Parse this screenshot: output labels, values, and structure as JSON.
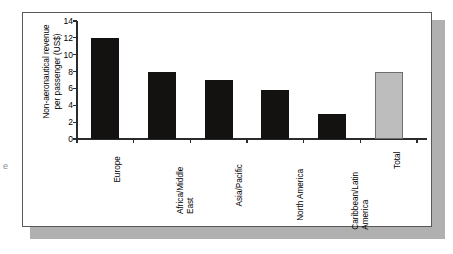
{
  "figure": {
    "artifact_text": "e",
    "background_color": "#ffffff",
    "panel_border_color": "#59595c",
    "shadow_color": "#b0b0b0"
  },
  "chart_data": {
    "type": "bar",
    "title": "",
    "xlabel": "",
    "ylabel": "Non-aeronautical revenue per passenger (US$)",
    "ylabel_line1": "Non-aeronautical revenue",
    "ylabel_line2": "per passenger (US$)",
    "ylim": [
      0,
      14
    ],
    "ytick_step": 2,
    "yticks": [
      0,
      2,
      4,
      6,
      8,
      10,
      12,
      14
    ],
    "ytick_labels": [
      "0",
      "2",
      "4",
      "6",
      "8",
      "10",
      "12",
      "14"
    ],
    "grid": false,
    "legend": null,
    "categories": [
      "Europe",
      "Africa/Middle East",
      "Asia/Pacific",
      "North America",
      "Caribbean/Latin America",
      "Total"
    ],
    "category_lines": [
      [
        "Europe"
      ],
      [
        "Africa/Middle",
        "East"
      ],
      [
        "Asia/Pacific"
      ],
      [
        "North America"
      ],
      [
        "Caribbean/Latin",
        "America"
      ],
      [
        "Total"
      ]
    ],
    "values": [
      12.0,
      8.0,
      7.0,
      5.8,
      3.0,
      8.0
    ],
    "bar_colors": [
      "#141210",
      "#141210",
      "#141210",
      "#141210",
      "#141210",
      "#bdbdbd"
    ],
    "bar_styles": [
      "dark",
      "dark",
      "dark",
      "dark",
      "dark",
      "light"
    ],
    "series": [
      {
        "name": "Non-aeronautical revenue per passenger (US$)",
        "values": [
          12.0,
          8.0,
          7.0,
          5.8,
          3.0,
          8.0
        ]
      }
    ],
    "colors": {
      "bar_dark": "#141210",
      "bar_light": "#bdbdbd",
      "bar_light_edge": "#6e6e6e",
      "axis": "#2b2b2b",
      "text": "#000000"
    }
  }
}
